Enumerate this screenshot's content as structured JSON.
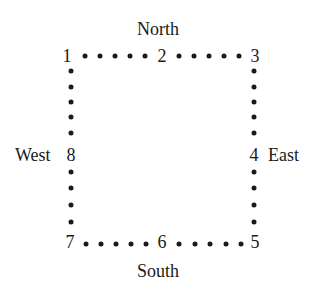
{
  "diagram": {
    "labels": {
      "north": "North",
      "south": "South",
      "west": "West",
      "east": "East"
    },
    "points": [
      {
        "id": "1",
        "x": 68,
        "y": 55
      },
      {
        "id": "2",
        "x": 162,
        "y": 55
      },
      {
        "id": "3",
        "x": 255,
        "y": 55
      },
      {
        "id": "4",
        "x": 255,
        "y": 155
      },
      {
        "id": "5",
        "x": 255,
        "y": 242
      },
      {
        "id": "6",
        "x": 162,
        "y": 242
      },
      {
        "id": "7",
        "x": 68,
        "y": 242
      },
      {
        "id": "8",
        "x": 71,
        "y": 155
      }
    ],
    "dot_color": "#1a1a1a"
  }
}
